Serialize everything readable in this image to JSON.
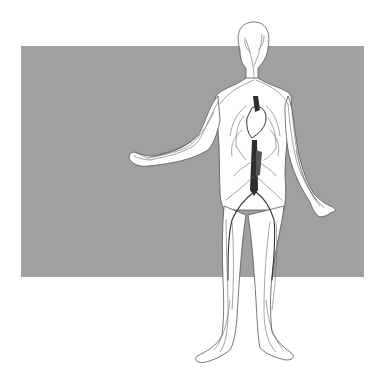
{
  "illustration": {
    "subject": "human circulatory system",
    "view": "full body, front, arms outstretched",
    "colors": {
      "page_background": "#ffffff",
      "backdrop": "#a0a0a0",
      "body_fill": "#ffffff",
      "outline": "#555555",
      "vessels": "#6a6a6a",
      "major_vessels": "#333333"
    },
    "backdrop_rect": {
      "x": 21,
      "y": 46,
      "width": 343,
      "height": 231
    }
  }
}
